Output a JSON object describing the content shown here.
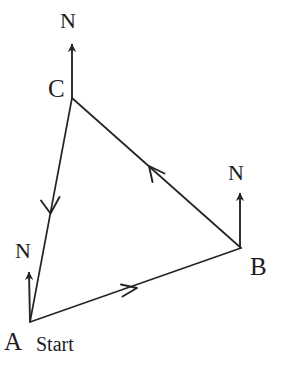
{
  "figure": {
    "background_color": "#ffffff",
    "stroke_color": "#252529",
    "text_color": "#1d1d1f",
    "width": 285,
    "height": 369
  },
  "vertices": [
    {
      "id": "A",
      "label": "A",
      "x": 30,
      "y": 322
    },
    {
      "id": "B",
      "label": "B",
      "x": 241,
      "y": 248
    },
    {
      "id": "C",
      "label": "C",
      "x": 72,
      "y": 98
    }
  ],
  "edges": [
    {
      "id": "AB",
      "label": "A to B",
      "from": "A",
      "to": "B",
      "arrow_position": 0.49
    },
    {
      "id": "BC",
      "label": "B to C",
      "from": "B",
      "to": "C",
      "arrow_position": 0.48
    },
    {
      "id": "CA",
      "label": "C to A",
      "from": "C",
      "to": "A",
      "arrow_position": 0.49
    }
  ],
  "north_arrows": [
    {
      "id": "N-A",
      "at_vertex": "A",
      "label": "N",
      "base_x": 30,
      "base_y": 322,
      "tip_x": 29,
      "tip_y": 272,
      "length": 50
    },
    {
      "id": "N-B",
      "at_vertex": "B",
      "label": "N",
      "base_x": 240,
      "base_y": 248,
      "tip_x": 240,
      "tip_y": 193,
      "length": 55
    },
    {
      "id": "N-C",
      "at_vertex": "C",
      "label": "N",
      "base_x": 72,
      "base_y": 98,
      "tip_x": 72,
      "tip_y": 44,
      "length": 54
    }
  ],
  "labels": {
    "vertex_a": "A",
    "vertex_b": "B",
    "vertex_c": "C",
    "start": "Start",
    "north_a": "N",
    "north_b": "N",
    "north_c": "N"
  }
}
